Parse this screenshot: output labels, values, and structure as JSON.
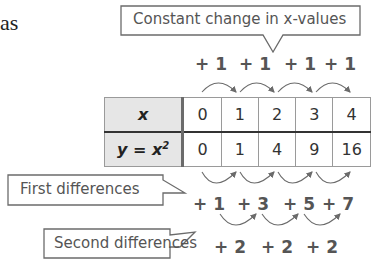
{
  "fragment_text": "as",
  "callouts": {
    "x_change": "Constant change in x-values",
    "first": "First differences",
    "second": "Second differences"
  },
  "table": {
    "row_x_label": "x",
    "row_y_label": "y = x",
    "row_y_exponent": "2",
    "x_values": [
      "0",
      "1",
      "2",
      "3",
      "4"
    ],
    "y_values": [
      "0",
      "1",
      "4",
      "9",
      "16"
    ]
  },
  "x_changes": [
    "+ 1",
    "+ 1",
    "+ 1",
    "+ 1"
  ],
  "first_differences": [
    "+ 1",
    "+ 3",
    "+ 5",
    "+ 7"
  ],
  "second_differences": [
    "+ 2",
    "+ 2",
    "+ 2"
  ],
  "colors": {
    "stroke": "#6b6b6b",
    "header_bg": "#e6e6e6",
    "text": "#555555"
  }
}
